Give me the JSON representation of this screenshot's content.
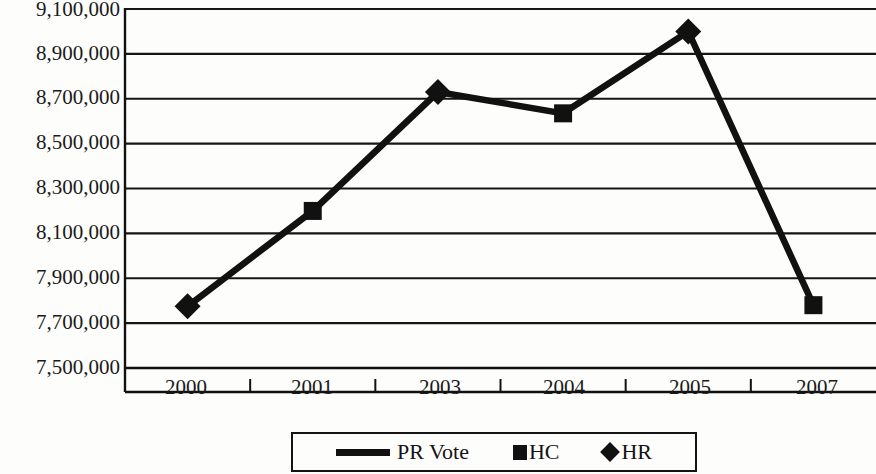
{
  "chart_data": {
    "type": "line",
    "title": "",
    "subtitle": "",
    "xlabel": "",
    "ylabel": "",
    "categories": [
      "2000",
      "2001",
      "2003",
      "2004",
      "2005",
      "2007"
    ],
    "series": [
      {
        "name": "PR Vote",
        "marker": "line",
        "values": [
          7775000,
          8200000,
          8730000,
          8635000,
          9000000,
          7780000
        ]
      }
    ],
    "point_markers": [
      "HR",
      "HC",
      "HR",
      "HC",
      "HR",
      "HC"
    ],
    "ylim": [
      7500000,
      9100000
    ],
    "ytick_values": [
      9100000,
      8900000,
      8700000,
      8500000,
      8300000,
      8100000,
      7900000,
      7700000,
      7500000
    ],
    "ytick_labels": [
      "9,100,000",
      "8,900,000",
      "8,700,000",
      "8,500,000",
      "8,300,000",
      "8,100,000",
      "7,900,000",
      "7,700,000",
      "7,500,000"
    ],
    "xtick_labels": [
      "2000",
      "2001",
      "2003",
      "2004",
      "2005",
      "2007"
    ],
    "grid": true,
    "grid_axis": "y",
    "legend_position": "bottom",
    "legend": [
      {
        "label": "PR Vote",
        "marker": "line"
      },
      {
        "label": "HC",
        "marker": "square"
      },
      {
        "label": "HR",
        "marker": "diamond"
      }
    ],
    "colors": {
      "line": "#111111",
      "marker": "#111111",
      "grid": "#161616",
      "axis": "#111111",
      "background": "#fdfdfb",
      "text": "#1a1a1a"
    }
  }
}
